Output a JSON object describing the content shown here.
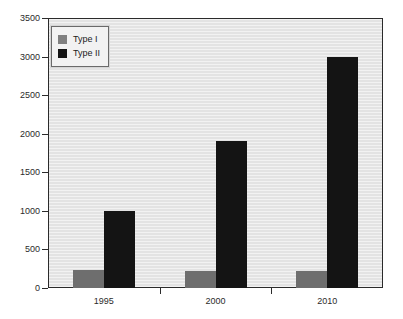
{
  "chart_data": {
    "type": "bar",
    "title": "",
    "xlabel": "",
    "ylabel": "",
    "categories": [
      "1995",
      "2000",
      "2010"
    ],
    "series": [
      {
        "name": "Type I",
        "values": [
          230,
          220,
          220
        ],
        "color": "#6e6e6e"
      },
      {
        "name": "Type II",
        "values": [
          1000,
          1900,
          3000
        ],
        "color": "#141414"
      }
    ],
    "ylim": [
      0,
      3500
    ],
    "yticks": [
      0,
      500,
      1000,
      1500,
      2000,
      2500,
      3000,
      3500
    ],
    "ytick_labels": [
      "0",
      "500",
      "1000",
      "1500",
      "2000",
      "2500",
      "3000",
      "3500"
    ],
    "grid": false,
    "legend_position": "top-left",
    "plot_background": "#e3e3e3",
    "axis_color": "#2b2b2b"
  },
  "legend": {
    "entries": [
      {
        "label": "Type I"
      },
      {
        "label": "Type II"
      }
    ]
  }
}
